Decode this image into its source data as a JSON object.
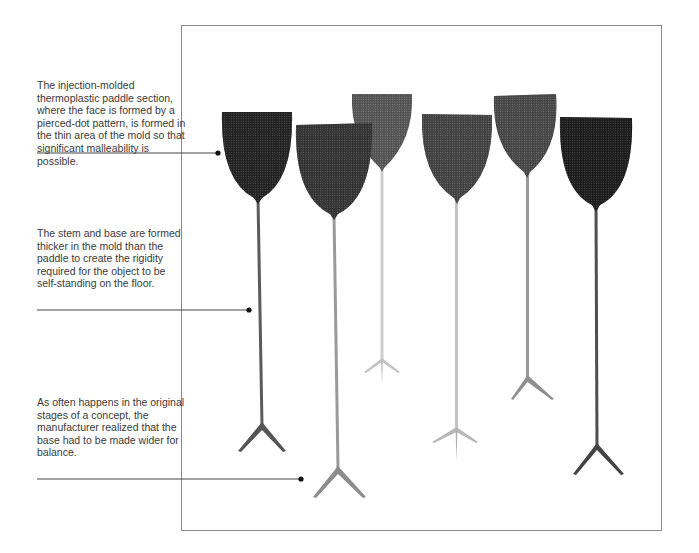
{
  "figure": {
    "paddle_count": 6
  },
  "callouts": [
    {
      "id": "paddle-section",
      "text": "The injection-molded thermoplastic paddle section, where the face is formed by a pierced-dot pattern, is formed in the thin area of the mold so that significant malleability is possible."
    },
    {
      "id": "stem-and-base",
      "text": "The stem and base are formed thicker in the mold than the paddle to create the rigidity required for the object to be self-standing on the floor."
    },
    {
      "id": "base-width",
      "text": "As often happens in the original stages of a concept, the manufacturer realized that the base had to be made wider for balance."
    }
  ],
  "paddles": [
    {
      "label": "paddle-1",
      "tone": "#4a4a4a"
    },
    {
      "label": "paddle-2",
      "tone": "#6e6e6e"
    },
    {
      "label": "paddle-3",
      "tone": "#c9c9c9"
    },
    {
      "label": "paddle-4",
      "tone": "#9e9e9e"
    },
    {
      "label": "paddle-5",
      "tone": "#a9a9a9"
    },
    {
      "label": "paddle-6",
      "tone": "#3c3c3c"
    }
  ],
  "colors": {
    "frame": "#8a8a8a",
    "leader_line": "#444444",
    "dot": "#111111",
    "text": "#3a3a3a"
  }
}
